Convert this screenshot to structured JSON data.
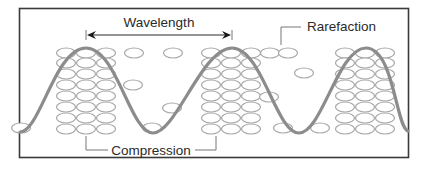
{
  "diagram": {
    "labels": {
      "wavelength": "Wavelength",
      "rarefaction": "Rarefaction",
      "compression": "Compression"
    },
    "colors": {
      "frame": "#3a3a3a",
      "wave": "#8c8c8c",
      "particle": "#a8a8a8",
      "text": "#2a2a2a",
      "leader": "#777777"
    },
    "clusters": [
      {
        "name": "compression-1",
        "columns": [
          66,
          86,
          106
        ]
      },
      {
        "name": "compression-2",
        "columns": [
          211,
          231,
          251
        ]
      },
      {
        "name": "compression-3",
        "columns": [
          345,
          365,
          385
        ]
      }
    ],
    "cluster_rows": [
      53,
      63,
      74,
      85,
      96,
      107,
      118,
      129
    ],
    "scattered_particles": [
      [
        134,
        53
      ],
      [
        173,
        53
      ],
      [
        133,
        85
      ],
      [
        172,
        108
      ],
      [
        152,
        128
      ],
      [
        270,
        53
      ],
      [
        288,
        53
      ],
      [
        269,
        97
      ],
      [
        304,
        73
      ],
      [
        283,
        128
      ],
      [
        320,
        128
      ],
      [
        21,
        128
      ]
    ]
  }
}
